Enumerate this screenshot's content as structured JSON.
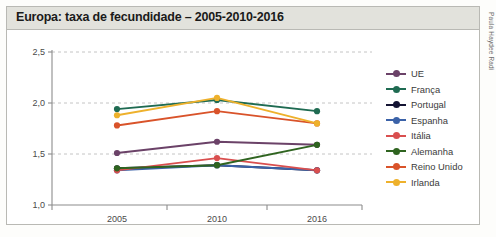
{
  "header": {
    "title": "Europa: taxa de fecundidade – 2005-2010-2016",
    "bar_color": "#e2e2dc"
  },
  "credit": "Paula Haydee Radi",
  "chart_data": {
    "type": "line",
    "title": "Europa: taxa de fecundidade – 2005-2010-2016",
    "xlabel": "",
    "ylabel": "",
    "categories": [
      "2005",
      "2010",
      "2016"
    ],
    "x_tick_labels": [
      "2005",
      "2010",
      "2016"
    ],
    "y_tick_labels": [
      "1,0",
      "1,5",
      "2,0",
      "2,5"
    ],
    "y_ticks": [
      1.0,
      1.5,
      2.0,
      2.5
    ],
    "ylim": [
      1.0,
      2.5
    ],
    "grid": "horizontal-dashed",
    "gridlines": [
      1.5,
      2.0,
      2.5
    ],
    "legend_position": "right",
    "series": [
      {
        "name": "UE",
        "color": "#6b4268",
        "values": [
          1.51,
          1.62,
          1.59
        ]
      },
      {
        "name": "França",
        "color": "#1f6b52",
        "values": [
          1.94,
          2.03,
          1.92
        ]
      },
      {
        "name": "Portugal",
        "color": "#141433",
        "values": [
          1.36,
          1.39,
          1.34
        ]
      },
      {
        "name": "Espanha",
        "color": "#3b62a8",
        "values": [
          1.34,
          1.39,
          1.34
        ]
      },
      {
        "name": "Itália",
        "color": "#d94f4f",
        "values": [
          1.34,
          1.46,
          1.34
        ]
      },
      {
        "name": "Alemanha",
        "color": "#2f6420",
        "values": [
          1.36,
          1.39,
          1.59
        ]
      },
      {
        "name": "Reino Unido",
        "color": "#d9532a",
        "values": [
          1.78,
          1.92,
          1.8
        ]
      },
      {
        "name": "Irlanda",
        "color": "#eeb12c",
        "values": [
          1.88,
          2.05,
          1.8
        ]
      }
    ]
  }
}
